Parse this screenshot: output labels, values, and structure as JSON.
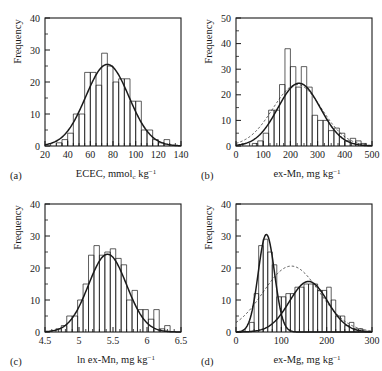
{
  "figure": {
    "title": "",
    "panel_count": 4,
    "background": "#ffffff",
    "ink": "#1a1a1a"
  },
  "chart_data": [
    {
      "type": "bar",
      "panel": "(a)",
      "title": "",
      "xlabel": "ECEC, mmol_c kg^-1",
      "xlabel_parts": {
        "main": "ECEC, mmol",
        "sub": "c",
        "tail": " kg",
        "sup": "−1"
      },
      "ylabel": "Frequency",
      "xlim": [
        20,
        140
      ],
      "ylim": [
        0,
        40
      ],
      "xticks": [
        20,
        40,
        60,
        80,
        100,
        120,
        140
      ],
      "xtick_labels": [
        "20",
        "40",
        "60",
        "80",
        "100",
        "120",
        "140"
      ],
      "yticks": [
        0,
        10,
        20,
        30,
        40
      ],
      "ytick_labels": [
        "0",
        "10",
        "20",
        "30",
        "40"
      ],
      "minor_x_per_major": 4,
      "minor_y_per_major": 2,
      "grid": false,
      "legend": null,
      "bin_width": 5,
      "bin_starts": [
        20,
        25,
        30,
        35,
        40,
        45,
        50,
        55,
        60,
        65,
        70,
        75,
        80,
        85,
        90,
        95,
        100,
        105,
        110,
        115,
        120,
        125,
        130
      ],
      "values": [
        0,
        0,
        1,
        2,
        4,
        10,
        10,
        23,
        23,
        19,
        29,
        25,
        20,
        21,
        21,
        14,
        14,
        5,
        5,
        2,
        1,
        2,
        0
      ],
      "curves": [
        {
          "name": "normal-fit",
          "style": "solid",
          "mean": 75,
          "sd": 19,
          "peak": 25.5
        }
      ]
    },
    {
      "type": "bar",
      "panel": "(b)",
      "title": "",
      "xlabel": "ex-Mn, mg kg^-1",
      "xlabel_parts": {
        "main": "ex-Mn, mg kg",
        "sub": "",
        "tail": "",
        "sup": "−1"
      },
      "ylabel": "Frequency",
      "xlim": [
        0,
        500
      ],
      "ylim": [
        0,
        50
      ],
      "xticks": [
        0,
        100,
        200,
        300,
        400,
        500
      ],
      "xtick_labels": [
        "0",
        "100",
        "200",
        "300",
        "400",
        "500"
      ],
      "yticks": [
        0,
        10,
        20,
        30,
        40,
        50
      ],
      "ytick_labels": [
        "0",
        "10",
        "20",
        "30",
        "40",
        "50"
      ],
      "minor_x_per_major": 4,
      "minor_y_per_major": 2,
      "grid": false,
      "legend": null,
      "bin_width": 20,
      "bin_starts": [
        0,
        20,
        40,
        60,
        80,
        100,
        120,
        140,
        160,
        180,
        200,
        220,
        240,
        260,
        280,
        300,
        320,
        340,
        360,
        380,
        400,
        420,
        440,
        460,
        480
      ],
      "values": [
        0,
        0,
        0,
        1,
        2,
        5,
        14,
        14,
        24,
        38,
        31,
        23,
        31,
        23,
        12,
        10,
        10,
        6,
        7,
        5,
        2,
        3,
        2,
        1,
        0
      ],
      "curves": [
        {
          "name": "normal-fit",
          "style": "solid",
          "mean": 232,
          "sd": 78,
          "peak": 24.5
        },
        {
          "name": "lognormal-fit",
          "style": "dashed",
          "mean": 225,
          "sd": 90,
          "peak": 24.0
        }
      ]
    },
    {
      "type": "bar",
      "panel": "(c)",
      "title": "",
      "xlabel": "ln ex-Mn, mg kg^-1",
      "xlabel_parts": {
        "main": "ln ex-Mn, mg kg",
        "sub": "",
        "tail": "",
        "sup": "−1"
      },
      "ylabel": "Frequency",
      "xlim": [
        4.5,
        6.5
      ],
      "ylim": [
        0,
        40
      ],
      "xticks": [
        4.5,
        5,
        5.5,
        6,
        6.5
      ],
      "xtick_labels": [
        "4.5",
        "5",
        "5.5",
        "6",
        "6.5"
      ],
      "yticks": [
        0,
        10,
        20,
        30,
        40
      ],
      "ytick_labels": [
        "0",
        "10",
        "20",
        "30",
        "40"
      ],
      "minor_x_per_major": 5,
      "minor_y_per_major": 2,
      "grid": false,
      "legend": null,
      "bin_width": 0.08,
      "bin_starts": [
        4.5,
        4.58,
        4.66,
        4.74,
        4.82,
        4.9,
        4.98,
        5.06,
        5.14,
        5.22,
        5.3,
        5.38,
        5.46,
        5.54,
        5.62,
        5.7,
        5.78,
        5.86,
        5.94,
        6.02,
        6.1,
        6.18,
        6.26,
        6.34,
        6.42
      ],
      "values": [
        0,
        0,
        1,
        2,
        5,
        5,
        10,
        15,
        24,
        27,
        24,
        25,
        26,
        23,
        21,
        10,
        13,
        7,
        7,
        4,
        7,
        1,
        2,
        0,
        0
      ],
      "curves": [
        {
          "name": "normal-fit",
          "style": "solid",
          "mean": 5.42,
          "sd": 0.28,
          "peak": 24.3
        }
      ]
    },
    {
      "type": "bar",
      "panel": "(d)",
      "title": "",
      "xlabel": "ex-Mg, mg kg^-1",
      "xlabel_parts": {
        "main": "ex-Mg, mg kg",
        "sub": "",
        "tail": "",
        "sup": "−1"
      },
      "ylabel": "Frequency",
      "xlim": [
        0,
        300
      ],
      "ylim": [
        0,
        40
      ],
      "xticks": [
        0,
        100,
        200,
        300
      ],
      "xtick_labels": [
        "0",
        "100",
        "200",
        "300"
      ],
      "yticks": [
        0,
        10,
        20,
        30,
        40
      ],
      "ytick_labels": [
        "0",
        "10",
        "20",
        "30",
        "40"
      ],
      "minor_x_per_major": 5,
      "minor_y_per_major": 2,
      "grid": false,
      "legend": null,
      "bin_width": 10,
      "bin_starts": [
        0,
        10,
        20,
        30,
        40,
        50,
        60,
        70,
        80,
        90,
        100,
        110,
        120,
        130,
        140,
        150,
        160,
        170,
        180,
        190,
        200,
        210,
        220,
        230,
        240,
        250,
        260,
        270,
        280,
        290
      ],
      "values": [
        0,
        0,
        0,
        3,
        12,
        27,
        29,
        25,
        21,
        11,
        11,
        12,
        12,
        14,
        14,
        15,
        15,
        15,
        13,
        13,
        14,
        10,
        5,
        5,
        2,
        3,
        1,
        1,
        0,
        0
      ],
      "curves": [
        {
          "name": "component-1-normal",
          "style": "solid",
          "mean": 67,
          "sd": 18,
          "peak": 30.5
        },
        {
          "name": "component-2-normal",
          "style": "solid",
          "mean": 160,
          "sd": 42,
          "peak": 15.8
        },
        {
          "name": "mixture-normal",
          "style": "dashed",
          "mean": 122,
          "sd": 62,
          "peak": 20.6
        }
      ]
    }
  ]
}
